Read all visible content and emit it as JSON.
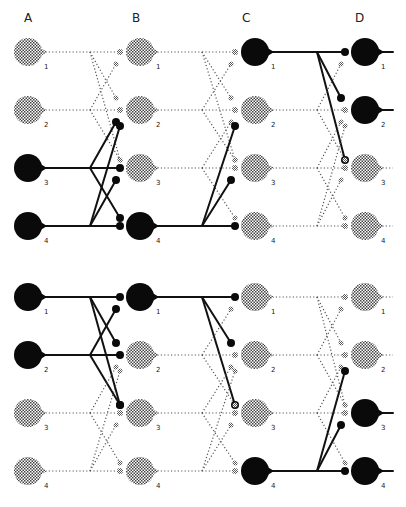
{
  "figure": {
    "columns": [
      {
        "id": "A",
        "label": "A",
        "x": 28
      },
      {
        "id": "B",
        "label": "B",
        "x": 140
      },
      {
        "id": "C",
        "label": "C",
        "x": 255
      },
      {
        "id": "D",
        "label": "D",
        "x": 365
      }
    ],
    "column_labels_y": 20,
    "colors": {
      "active": "#0a0a0a",
      "inactive_stipple": "#555555",
      "background": "#ffffff"
    },
    "panels": [
      {
        "name": "top-panel",
        "rows_y": [
          52,
          110,
          168,
          226
        ],
        "unit_labels": [
          "1",
          "2",
          "3",
          "4"
        ],
        "active": {
          "A": [
            3,
            4
          ],
          "B": [
            4
          ],
          "C": [
            1
          ],
          "D": [
            1,
            2
          ]
        }
      },
      {
        "name": "bottom-panel",
        "rows_y": [
          297,
          355,
          413,
          471
        ],
        "unit_labels": [
          "1",
          "2",
          "3",
          "4"
        ],
        "active": {
          "A": [
            1,
            2
          ],
          "B": [
            1
          ],
          "C": [
            4
          ],
          "D": [
            3,
            4
          ]
        }
      }
    ]
  }
}
